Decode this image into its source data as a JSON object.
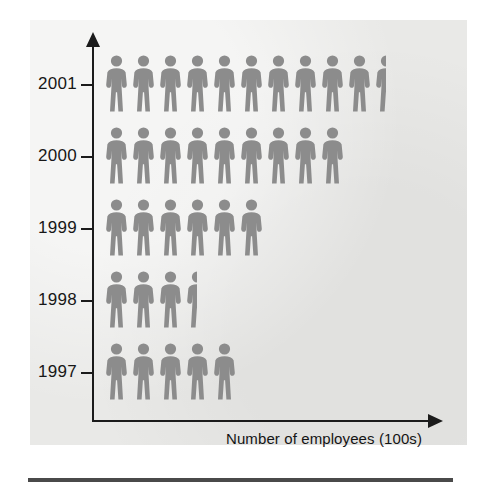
{
  "chart_data": {
    "type": "bar",
    "style": "pictogram",
    "title": "",
    "subtitle": "",
    "xlabel": "Number of employees (100s)",
    "ylabel": "",
    "categories": [
      "2001",
      "2000",
      "1999",
      "1998",
      "1997"
    ],
    "values": [
      10.5,
      9,
      6,
      3.5,
      5
    ],
    "icon_unit": 1,
    "icon_name": "person-icon",
    "icon_value_label": "1 figure = 100 employees",
    "grid": false,
    "legend": null,
    "xlim": [
      0,
      12
    ],
    "axis_direction": "rows plotted bottom-to-top 1997 to 2001",
    "annotations": [],
    "rows": [
      {
        "label": "2001",
        "value": 10.5,
        "full_icons": 10,
        "half_icons": 1
      },
      {
        "label": "2000",
        "value": 9,
        "full_icons": 9,
        "half_icons": 0
      },
      {
        "label": "1999",
        "value": 6,
        "full_icons": 6,
        "half_icons": 0
      },
      {
        "label": "1998",
        "value": 3.5,
        "full_icons": 3,
        "half_icons": 1
      },
      {
        "label": "1997",
        "value": 5,
        "full_icons": 5,
        "half_icons": 0
      }
    ]
  },
  "axis": {
    "x_label": "Number of employees (100s)",
    "y_tick_labels": [
      "2001",
      "2000",
      "1999",
      "1998",
      "1997"
    ],
    "x_arrow": "arrow-right",
    "y_arrow": "arrow-up"
  },
  "colors": {
    "panel_background": "#e9e9e7",
    "figure_fill": "#8c8c8c",
    "axis": "#1b1b1b",
    "text": "#171717",
    "bottom_rule": "#4a4a4a",
    "page_background": "#ffffff"
  }
}
